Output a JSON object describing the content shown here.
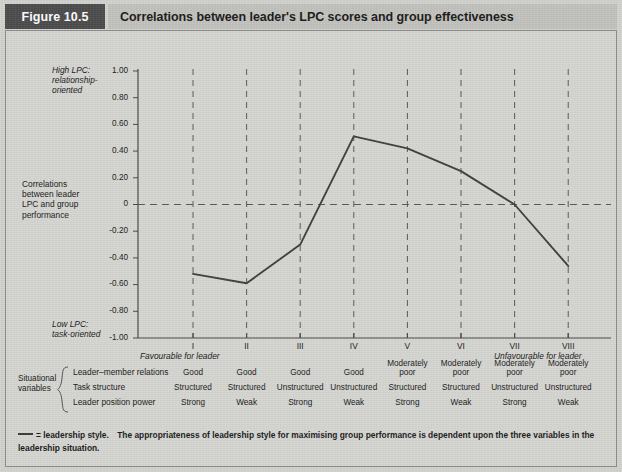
{
  "figure": {
    "badge": "Figure 10.5",
    "title": "Correlations between leader's LPC scores and group effectiveness"
  },
  "chart_data": {
    "type": "line",
    "title": "Correlations between leader's LPC scores and group effectiveness",
    "xlabel": "",
    "ylabel": "Correlations between leader LPC and group performance",
    "categories": [
      "I",
      "II",
      "III",
      "IV",
      "V",
      "VI",
      "VII",
      "VIII"
    ],
    "values": [
      -0.52,
      -0.59,
      -0.3,
      0.51,
      0.42,
      0.25,
      0.0,
      -0.46
    ],
    "ylim": [
      -1.0,
      1.0
    ],
    "ytick_labels": [
      "1.00",
      "0.80",
      "0.60",
      "0.40",
      "0.20",
      "0",
      "-0.20",
      "-0.40",
      "-0.60",
      "-0.80",
      "-1.00"
    ],
    "ytick_values": [
      1.0,
      0.8,
      0.6,
      0.4,
      0.2,
      0,
      -0.2,
      -0.4,
      -0.6,
      -0.8,
      -1.0
    ],
    "grid": "vertical dashed at each category, horizontal dashed at zero",
    "legend": "leadership style",
    "series_color": "#3f3f3f",
    "axis_color": "#4a4a4a",
    "grid_color": "#5a5a5a"
  },
  "axis_notes": {
    "y_top": "High LPC:\nrelationship-\noriented",
    "y_top_lines": [
      "High LPC:",
      "relationship-",
      "oriented"
    ],
    "y_middle_lines": [
      "Correlations",
      "between leader",
      "LPC and group",
      "performance"
    ],
    "y_bottom_lines": [
      "Low LPC:",
      "task-oriented"
    ],
    "x_left": "Favourable for leader",
    "x_right": "Unfavourable for leader"
  },
  "table": {
    "group_label_lines": [
      "Situational",
      "variables"
    ],
    "row_labels": [
      "Leader–member relations",
      "Task structure",
      "Leader position power"
    ],
    "rows": [
      [
        "Good",
        "Good",
        "Good",
        "Good",
        "Moderately\npoor",
        "Moderately\npoor",
        "Moderately\npoor",
        "Moderately\npoor"
      ],
      [
        "Structured",
        "Structured",
        "Unstructured",
        "Unstructured",
        "Structured",
        "Structured",
        "Unstructured",
        "Unstructured"
      ],
      [
        "Strong",
        "Weak",
        "Strong",
        "Weak",
        "Strong",
        "Weak",
        "Strong",
        "Weak"
      ]
    ]
  },
  "footer": {
    "legend_symbol": "line-dash",
    "text": "= leadership style. The appropriateness of leadership style for maximising group performance is dependent upon the three variables in the leadership situation."
  },
  "colors": {
    "page_background": "#d2d2ce",
    "badge_background": "#4c4c4c",
    "title_background": "#c2c2be",
    "ink": "#1a1a1a",
    "line": "#3f3f3f"
  }
}
